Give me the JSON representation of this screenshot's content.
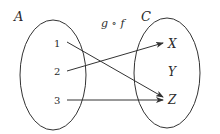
{
  "diagram": {
    "type": "function-mapping",
    "function_label": "g ∘ f",
    "domain_set": {
      "label": "A",
      "elements": [
        "1",
        "2",
        "3"
      ]
    },
    "codomain_set": {
      "label": "C",
      "elements": [
        "X",
        "Y",
        "Z"
      ]
    },
    "mappings": [
      {
        "from": "1",
        "to": "Z"
      },
      {
        "from": "2",
        "to": "X"
      },
      {
        "from": "3",
        "to": "Z"
      }
    ],
    "colors": {
      "stroke": "#333333",
      "text": "#2a2a2a",
      "background": "#ffffff"
    }
  }
}
